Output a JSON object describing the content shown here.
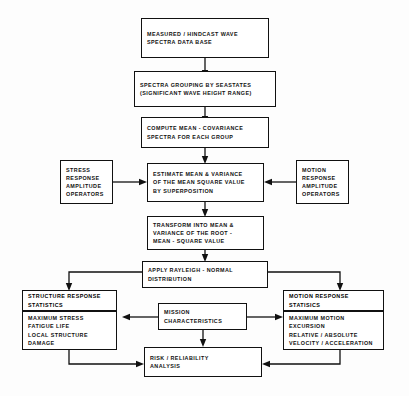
{
  "diagram": {
    "background_color": "#ffffff",
    "line_color": "#111111"
  },
  "nodes": {
    "wave_database": {
      "name": "measured-hindcast-wave-spectra-database",
      "lines": [
        "MEASURED / HINDCAST WAVE",
        "SPECTRA  DATA  BASE"
      ]
    },
    "spectra_grouping": {
      "name": "spectra-grouping-by-seastates",
      "lines": [
        "SPECTRA GROUPING BY SEASTATES",
        "(SIGNIFICANT  WAVE  HEIGHT  RANGE)"
      ]
    },
    "compute_mean_covariance": {
      "name": "compute-mean-covariance-spectra",
      "lines": [
        "COMPUTE  MEAN - COVARIANCE",
        "SPECTRA  FOR  EACH  GROUP"
      ]
    },
    "stress_rao": {
      "name": "stress-response-amplitude-operators",
      "lines": [
        "STRESS",
        "RESPONSE",
        "AMPLITUDE",
        "OPERATORS"
      ]
    },
    "estimate_mean_variance": {
      "name": "estimate-mean-variance-mean-square-value",
      "lines": [
        "ESTIMATE  MEAN &  VARIANCE",
        "OF  THE  MEAN  SQUARE  VALUE",
        "BY  SUPERPOSITION"
      ]
    },
    "motion_rao": {
      "name": "motion-response-amplitude-operators",
      "lines": [
        "MOTION",
        "RESPONSE",
        "AMPLITUDE",
        "OPERATORS"
      ]
    },
    "transform_rms": {
      "name": "transform-into-mean-variance-root-mean-square",
      "lines": [
        "TRANSFORM  INTO  MEAN &",
        "VARIANCE  OF  THE  ROOT -",
        "MEAN - SQUARE  VALUE"
      ]
    },
    "apply_rayleigh": {
      "name": "apply-rayleigh-normal-distribution",
      "lines": [
        "APPLY  RAYLEIGH - NORMAL",
        "DISTRIBUTION"
      ]
    },
    "structure_stats_header": {
      "name": "structure-response-statistics-header",
      "lines": [
        "STRUCTURE  RESPONSE",
        "STATISTICS"
      ]
    },
    "structure_stats_body": {
      "name": "structure-response-statistics-body",
      "lines": [
        "MAXIMUM  STRESS",
        "FATIGUE  LIFE",
        "LOCAL  STRUCTURE",
        "DAMAGE"
      ]
    },
    "mission_characteristics": {
      "name": "mission-characteristics",
      "lines": [
        "MISSION",
        "CHARACTERISTICS"
      ]
    },
    "motion_stats_header": {
      "name": "motion-response-statistics-header",
      "lines": [
        "MOTION  RESPONSE",
        "STATISICS"
      ]
    },
    "motion_stats_body": {
      "name": "motion-response-statistics-body",
      "lines": [
        "MAXIMUM  MOTION",
        "EXCURSION",
        "RELATIVE / ABSOLUTE",
        "VELOCITY / ACCELERATION"
      ]
    },
    "risk_reliability": {
      "name": "risk-reliability-analysis",
      "lines": [
        "RISK  /  RELIABILITY",
        "ANALYSIS"
      ]
    }
  }
}
